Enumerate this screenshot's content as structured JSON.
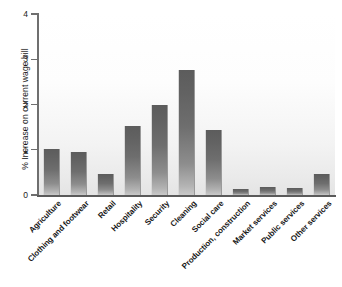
{
  "chart_data": {
    "type": "bar",
    "title": "",
    "xlabel": "",
    "ylabel": "% Increase on current wage bill",
    "ylim": [
      0,
      4
    ],
    "yticks": [
      0,
      1,
      2,
      3,
      4
    ],
    "ytick_labels": [
      "0",
      "1",
      "2",
      "3",
      "4"
    ],
    "grid": false,
    "legend": "none",
    "bar_color": "#6e6e6e",
    "categories": [
      "Agriculture",
      "Clothing and footwear",
      "Retail",
      "Hospitality",
      "Security",
      "Cleaning",
      "Social care",
      "Production, construction",
      "Market services",
      "Public services",
      "Other services"
    ],
    "values": [
      1.02,
      0.95,
      0.47,
      1.52,
      2.0,
      2.76,
      1.44,
      0.14,
      0.18,
      0.15,
      0.46
    ]
  },
  "caption": {
    "text": ""
  }
}
